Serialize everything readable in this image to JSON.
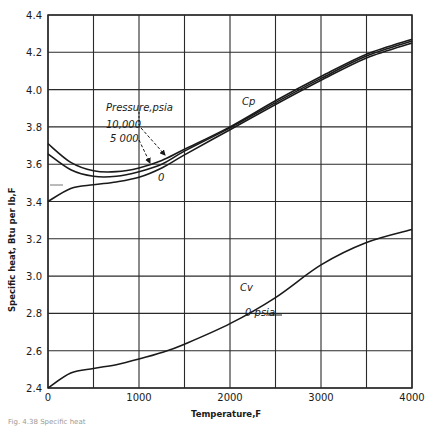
{
  "chart_data": {
    "type": "line",
    "title": "",
    "xlabel": "Temperature, F",
    "ylabel": "Specific heat, Btu per lb, F",
    "xlim": [
      0,
      4000
    ],
    "ylim": [
      2.4,
      4.4
    ],
    "x_ticks": [
      0,
      1000,
      2000,
      3000,
      4000
    ],
    "x_tick_labels": [
      "0",
      "1000",
      "2000",
      "3000",
      "4000"
    ],
    "y_ticks": [
      2.4,
      2.6,
      2.8,
      3.0,
      3.2,
      3.4,
      3.6,
      3.8,
      4.0,
      4.2,
      4.4
    ],
    "y_tick_labels": [
      "2.4",
      "2.6",
      "2.8",
      "3.0",
      "3.2",
      "3.4",
      "3.6",
      "3.8",
      "4.0",
      "4.2",
      "4.4"
    ],
    "grid": true,
    "grid_x_step": 500,
    "grid_y_step": 0.2,
    "x": [
      0,
      250,
      500,
      750,
      1000,
      1250,
      1500,
      2000,
      2500,
      3000,
      3500,
      4000
    ],
    "series": [
      {
        "name": "Cp, 10,000 psia",
        "values": [
          3.71,
          3.61,
          3.565,
          3.56,
          3.58,
          3.62,
          3.68,
          3.8,
          3.94,
          4.07,
          4.19,
          4.27
        ]
      },
      {
        "name": "Cp, 5 000 psia",
        "values": [
          3.655,
          3.57,
          3.535,
          3.535,
          3.56,
          3.6,
          3.67,
          3.795,
          3.93,
          4.06,
          4.18,
          4.26
        ]
      },
      {
        "name": "Cp, 0 psia",
        "values": [
          3.4,
          3.47,
          3.49,
          3.505,
          3.53,
          3.58,
          3.65,
          3.785,
          3.92,
          4.05,
          4.17,
          4.25
        ]
      },
      {
        "name": "Cv, 0 psia",
        "values": [
          2.4,
          2.48,
          2.505,
          2.525,
          2.555,
          2.59,
          2.635,
          2.745,
          2.885,
          3.06,
          3.18,
          3.25
        ]
      }
    ],
    "annotations": [
      {
        "text": "Pressure, psia",
        "x": 1000,
        "y": 3.89
      },
      {
        "text": "10,000",
        "x": 950,
        "y": 3.8
      },
      {
        "text": "5 000",
        "x": 900,
        "y": 3.735
      },
      {
        "text": "0",
        "x": 1550,
        "y": 3.525
      },
      {
        "text": "Cp",
        "x": 2150,
        "y": 3.88
      },
      {
        "text": "Cv",
        "x": 2050,
        "y": 2.95
      },
      {
        "text": "0 psia",
        "x": 2200,
        "y": 2.82
      }
    ],
    "legend": "none (inline annotations)"
  },
  "labels": {
    "x_axis": "Temperature,F",
    "y_axis": "Specific heat, Btu per lb,F",
    "pressure_header": "Pressure,psia",
    "p10000": "10,000",
    "p5000": "5 000",
    "p0": "0",
    "cp": "Cp",
    "cv": "Cv",
    "cv_psia": "0 psia",
    "caption": "Fig. 4.38 Specific heat"
  },
  "colors": {
    "line": "#1a1a1a",
    "grid": "#2a2a2a",
    "background": "#ffffff"
  }
}
